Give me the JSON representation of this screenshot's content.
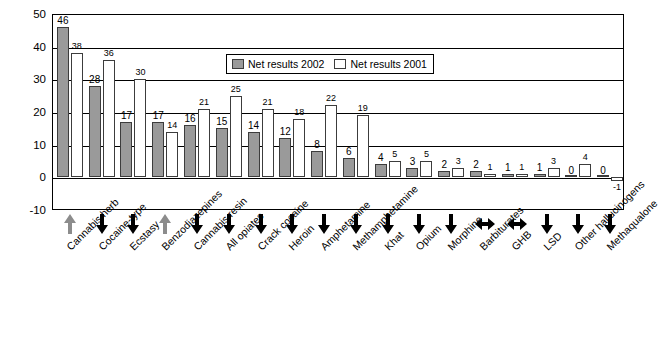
{
  "chart_data": {
    "type": "bar",
    "title": "",
    "xlabel": "",
    "ylabel": "",
    "ylim": [
      -10,
      50
    ],
    "yticks": [
      -10,
      0,
      10,
      20,
      30,
      40,
      50
    ],
    "grid": true,
    "legend_position": "top-center",
    "categories": [
      "Cannabis herb",
      "Cocaine-type",
      "Ecstasy",
      "Benzodiazepines",
      "Cannabis resin",
      "All opiates",
      "Crack cocaine",
      "Heroin",
      "Amphetamine",
      "Methamphetamine",
      "Khat",
      "Opium",
      "Morphine",
      "Barbiturates",
      "GHB",
      "LSD",
      "Other hallucinogens",
      "Methaqualone"
    ],
    "series": [
      {
        "name": "Net results 2002",
        "color": "#9a9a9a",
        "values": [
          46,
          28,
          17,
          17,
          16,
          15,
          14,
          12,
          8,
          6,
          4,
          3,
          2,
          2,
          1,
          1,
          0,
          0
        ]
      },
      {
        "name": "Net results 2001",
        "color": "#ffffff",
        "values": [
          38,
          36,
          30,
          14,
          21,
          25,
          21,
          18,
          22,
          19,
          5,
          5,
          3,
          1,
          1,
          3,
          4,
          -1
        ]
      }
    ],
    "trend_arrows": [
      "up",
      "down",
      "down",
      "up",
      "down",
      "down",
      "down",
      "down",
      "down",
      "down",
      "down",
      "down",
      "down",
      "left-right",
      "left-right",
      "down",
      "down",
      "down"
    ]
  },
  "legend": {
    "items": [
      {
        "label": "Net results 2002",
        "swatch": "grey"
      },
      {
        "label": "Net results 2001",
        "swatch": "white"
      }
    ]
  }
}
